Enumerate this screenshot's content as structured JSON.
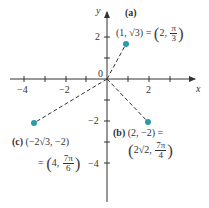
{
  "diagram": {
    "type": "polar-cartesian-coordinate-plot",
    "axes": {
      "x_label": "x",
      "y_label": "y",
      "origin_label": "0",
      "x_ticks": [
        {
          "value": -4,
          "label": "−4"
        },
        {
          "value": -2,
          "label": "−2"
        },
        {
          "value": 2,
          "label": "2"
        }
      ],
      "y_ticks": [
        {
          "value": 2,
          "label": "2"
        },
        {
          "value": -2,
          "label": "−2"
        },
        {
          "value": -4,
          "label": "−4"
        }
      ]
    },
    "points": [
      {
        "id": "a",
        "tag": "(a)",
        "cartesian": "(1, √3)",
        "eq": "=",
        "polar_r": "2",
        "polar_theta_num": "π",
        "polar_theta_den": "3",
        "x": 1,
        "y": 1.732
      },
      {
        "id": "b",
        "tag": "(b)",
        "cartesian": "(2, −2) =",
        "polar_r": "2√2",
        "polar_theta_num": "7π",
        "polar_theta_den": "4",
        "x": 2,
        "y": -2
      },
      {
        "id": "c",
        "tag": "(c)",
        "cartesian": "(−2√3, −2)",
        "eq": "=",
        "polar_r": "4",
        "polar_theta_num": "7π",
        "polar_theta_den": "6",
        "x": -3.464,
        "y": -2
      }
    ],
    "colors": {
      "point": "#2a9aa8",
      "axis": "#333333",
      "segment": "#333333"
    }
  }
}
